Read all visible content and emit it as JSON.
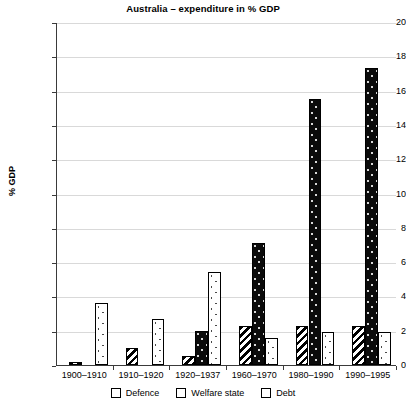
{
  "chart_data": {
    "type": "bar",
    "title": "Australia – expenditure in % GDP",
    "xlabel": "",
    "ylabel": "% GDP",
    "ylim": [
      0,
      20
    ],
    "ytick_step": 2,
    "yticks": [
      "20",
      "18",
      "16",
      "14",
      "12",
      "10",
      "8",
      "6",
      "4",
      "2",
      "0"
    ],
    "grid": true,
    "legend_position": "bottom",
    "categories": [
      "1900–1910",
      "1910–1920",
      "1920–1937",
      "1960–1970",
      "1980–1990",
      "1990–1995"
    ],
    "series": [
      {
        "name": "Defence",
        "values": [
          0.15,
          1.0,
          0.5,
          2.3,
          2.3,
          2.3
        ]
      },
      {
        "name": "Welfare state",
        "values": [
          0,
          0,
          2.0,
          7.1,
          15.5,
          17.3
        ]
      },
      {
        "name": "Debt",
        "values": [
          3.6,
          2.7,
          5.4,
          1.6,
          1.9,
          1.9
        ]
      }
    ]
  },
  "legend": {
    "items": [
      {
        "label": "Defence",
        "pattern": "diagonal-stripes"
      },
      {
        "label": "Welfare state",
        "pattern": "solid-black"
      },
      {
        "label": "Debt",
        "pattern": "dotted-white"
      }
    ]
  }
}
